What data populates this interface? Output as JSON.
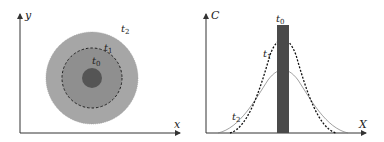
{
  "left_panel": {
    "y_axis_label": "y",
    "x_axis_label": "x",
    "labels": {
      "t0": "t",
      "t0_sub": "0",
      "t1": "t",
      "t1_sub": "1",
      "t2": "t",
      "t2_sub": "2"
    },
    "colors": {
      "outer": "#a6a6a6",
      "middle": "#8f8f8f",
      "core": "#555555",
      "axis": "#333333"
    }
  },
  "right_panel": {
    "y_axis_label": "C",
    "x_axis_label": "X",
    "labels": {
      "t0": "t",
      "t0_sub": "0",
      "t1": "t",
      "t1_sub": "1",
      "t2": "t",
      "t2_sub": "2"
    },
    "colors": {
      "bar": "#4a4a4a",
      "curve_t1": "#111111",
      "curve_t2": "#777777",
      "axis": "#333333"
    }
  }
}
